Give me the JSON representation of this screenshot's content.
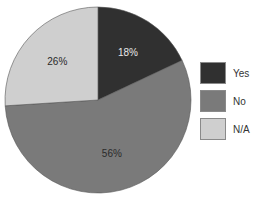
{
  "chart_data": {
    "type": "pie",
    "title": "",
    "categories": [
      "Yes",
      "No",
      "N/A"
    ],
    "values": [
      18,
      56,
      26
    ],
    "labels": [
      "18%",
      "56%",
      "26%"
    ],
    "colors": [
      "#303030",
      "#7a7a7a",
      "#cfcfcf"
    ],
    "label_colors": [
      "#e8e8e8",
      "#2a2a2a",
      "#2a2a2a"
    ],
    "start_angle_deg": 0,
    "direction": "clockwise",
    "legend_position": "right"
  },
  "legend": {
    "items": [
      {
        "label": "Yes",
        "color": "#303030"
      },
      {
        "label": "No",
        "color": "#7a7a7a"
      },
      {
        "label": "N/A",
        "color": "#cfcfcf"
      }
    ]
  }
}
